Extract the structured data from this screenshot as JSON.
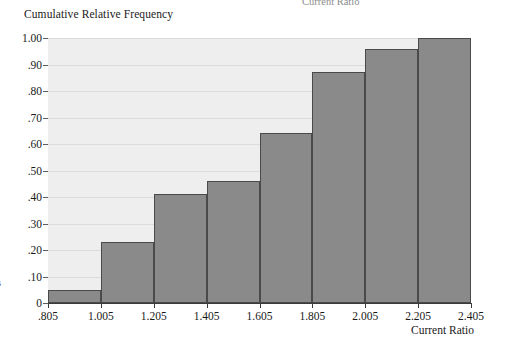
{
  "chart_data": {
    "type": "bar",
    "title": "",
    "ylabel": "Cumulative Relative Frequency",
    "xlabel": "Current Ratio",
    "categories": [
      "0.805-1.005",
      "1.005-1.205",
      "1.205-1.405",
      "1.405-1.605",
      "1.605-1.805",
      "1.805-2.005",
      "2.005-2.205",
      "2.205-2.405"
    ],
    "values": [
      0.05,
      0.23,
      0.41,
      0.46,
      0.64,
      0.87,
      0.96,
      1.0
    ],
    "bin_edges": [
      0.805,
      1.005,
      1.205,
      1.405,
      1.605,
      1.805,
      2.005,
      2.205,
      2.405
    ],
    "x_tick_labels": [
      ".805",
      "1.005",
      "1.205",
      "1.405",
      "1.605",
      "1.805",
      "2.005",
      "2.205",
      "2.405"
    ],
    "y_tick_labels": [
      "0",
      ".10",
      ".20",
      ".30",
      ".40",
      ".50",
      ".60",
      ".70",
      ".80",
      ".90",
      "1.00"
    ],
    "y_tick_values": [
      0,
      0.1,
      0.2,
      0.3,
      0.4,
      0.5,
      0.6,
      0.7,
      0.8,
      0.9,
      1.0
    ],
    "ylim": [
      0,
      1.0
    ],
    "xlim": [
      0.805,
      2.405
    ],
    "grid": "horizontal",
    "legend": "none",
    "bar_color": "#8a8a8a",
    "bar_border_color": "#4a4a4a",
    "plot_background": "#eeeeee",
    "gridline_color": "#dcdcdc"
  },
  "artifacts": {
    "top_clipped_text": "Current Ratio",
    "left_clipped_text": "s"
  }
}
